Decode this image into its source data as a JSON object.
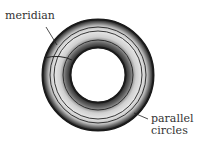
{
  "labels": {
    "meridian": "meridian",
    "parallel_line1": "parallel",
    "parallel_line2": "circles"
  },
  "figure": {
    "center": [
      98,
      75
    ],
    "outer_radius": 56,
    "inner_radius": 27,
    "colors": {
      "ink": "#222222",
      "shade": "#9a9a9a",
      "light": "#dcdcdc"
    }
  }
}
